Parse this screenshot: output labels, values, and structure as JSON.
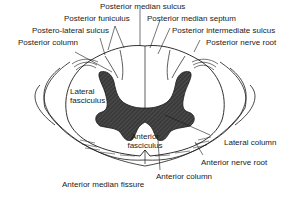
{
  "diagram": {
    "labels": {
      "posterior_median_sulcus": "Posterior median sulcus",
      "posterior_funiculus": "Posterior funiculus",
      "posterior_median_septum": "Posterior median septum",
      "postero_lateral_sulcus": "Postero-lateral sulcus",
      "posterior_intermediate_sulcus": "Posterior intermediate sulcus",
      "posterior_column": "Posterior column",
      "posterior_nerve_root": "Posterior nerve root",
      "lateral_fasciculus_line1": "Lateral",
      "lateral_fasciculus_line2": "fasciculus",
      "anterior_fasciculus_line1": "Anterior",
      "anterior_fasciculus_line2": "fasciculus",
      "lateral_column": "Lateral column",
      "anterior_nerve_root": "Anterior nerve root",
      "anterior_median_fissure": "Anterior median fissure",
      "anterior_column": "Anterior column"
    },
    "colors": {
      "line": "#1a1a1a",
      "grey_matter": "#3a3a3a",
      "background": "#ffffff"
    }
  }
}
